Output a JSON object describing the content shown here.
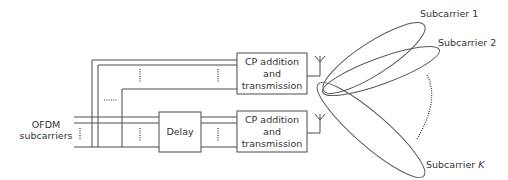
{
  "diagram": {
    "input_label_line1": "OFDM",
    "input_label_line2": "subcarriers",
    "delay_label": "Delay",
    "tx_block_1": {
      "line1": "CP addition",
      "line2": "and",
      "line3": "transmission"
    },
    "tx_block_2": {
      "line1": "CP addition",
      "line2": "and",
      "line3": "transmission"
    },
    "beams": [
      {
        "label": "Subcarrier 1",
        "italic_suffix": ""
      },
      {
        "label": "Subcarrier 2",
        "italic_suffix": ""
      },
      {
        "label": "Subcarrier ",
        "italic_suffix": "K"
      }
    ],
    "colors": {
      "line": "#4a4a4a",
      "text": "#333333",
      "background": "#ffffff"
    }
  }
}
